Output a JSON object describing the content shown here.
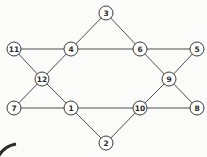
{
  "diagram": {
    "type": "graph",
    "node_radius": 7,
    "colors": {
      "stroke": "#3a3a3a",
      "fill": "#ffffff",
      "label": "#2a2a2a",
      "background": "#fbfbfa"
    },
    "nodes": [
      {
        "id": "1",
        "label": "1",
        "x": 71,
        "y": 108
      },
      {
        "id": "2",
        "label": "2",
        "x": 106,
        "y": 143
      },
      {
        "id": "3",
        "label": "3",
        "x": 106,
        "y": 13
      },
      {
        "id": "4",
        "label": "4",
        "x": 71,
        "y": 49
      },
      {
        "id": "5",
        "label": "5",
        "x": 197,
        "y": 49
      },
      {
        "id": "6",
        "label": "6",
        "x": 140,
        "y": 49
      },
      {
        "id": "7",
        "label": "7",
        "x": 14,
        "y": 108
      },
      {
        "id": "8",
        "label": "8",
        "x": 197,
        "y": 108
      },
      {
        "id": "9",
        "label": "9",
        "x": 169,
        "y": 79
      },
      {
        "id": "10",
        "label": "10",
        "x": 140,
        "y": 108
      },
      {
        "id": "11",
        "label": "11",
        "x": 14,
        "y": 49
      },
      {
        "id": "12",
        "label": "12",
        "x": 42,
        "y": 79
      }
    ],
    "edges": [
      [
        "3",
        "4"
      ],
      [
        "3",
        "6"
      ],
      [
        "11",
        "4"
      ],
      [
        "4",
        "6"
      ],
      [
        "6",
        "5"
      ],
      [
        "11",
        "12"
      ],
      [
        "4",
        "12"
      ],
      [
        "6",
        "9"
      ],
      [
        "5",
        "9"
      ],
      [
        "12",
        "7"
      ],
      [
        "12",
        "1"
      ],
      [
        "9",
        "10"
      ],
      [
        "9",
        "8"
      ],
      [
        "7",
        "1"
      ],
      [
        "1",
        "10"
      ],
      [
        "10",
        "8"
      ],
      [
        "1",
        "2"
      ],
      [
        "10",
        "2"
      ]
    ]
  }
}
